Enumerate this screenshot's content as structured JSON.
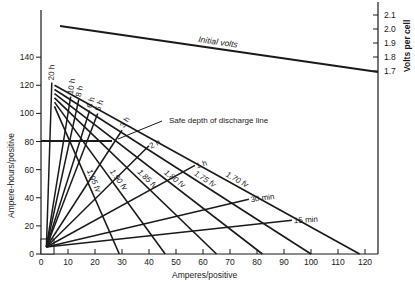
{
  "chart_data": {
    "type": "line",
    "title": "",
    "xlabel": "Amperes/positive",
    "ylabel": "Ampere-hours/positive",
    "y2label": "Volts per cell",
    "xlim": [
      0,
      125
    ],
    "ylim": [
      0,
      160
    ],
    "y2lim": [
      1.7,
      2.1
    ],
    "grid": false,
    "legend": "none",
    "x_ticks": [
      0,
      10,
      20,
      30,
      40,
      50,
      60,
      70,
      80,
      90,
      100,
      110,
      120
    ],
    "y_ticks": [
      0,
      20,
      40,
      60,
      80,
      100,
      120,
      140
    ],
    "y2_ticks": [
      "1.7",
      "1.8",
      "1.9",
      "2.0",
      "2.1"
    ],
    "initial_volts": {
      "label": "Initial volts",
      "points": [
        [
          7,
          2.08
        ],
        [
          125,
          1.69
        ]
      ]
    },
    "safe_depth": {
      "label": "Safe depth of discharge line",
      "ampere_hours": 80,
      "x_range": [
        0,
        26
      ]
    },
    "discharge_time_lines": [
      {
        "label": "20 h",
        "from": [
          2,
          5
        ],
        "to": [
          4,
          122
        ]
      },
      {
        "label": "10 h",
        "from": [
          2,
          5
        ],
        "to": [
          11,
          112
        ]
      },
      {
        "label": "8 h",
        "from": [
          2,
          5
        ],
        "to": [
          14,
          110
        ]
      },
      {
        "label": "6 h",
        "from": [
          2,
          5
        ],
        "to": [
          18,
          102
        ]
      },
      {
        "label": "5 h",
        "from": [
          2,
          5
        ],
        "to": [
          21,
          100
        ]
      },
      {
        "label": "3 h",
        "from": [
          2,
          5
        ],
        "to": [
          30,
          88
        ]
      },
      {
        "label": "2 h",
        "from": [
          2,
          5
        ],
        "to": [
          40,
          77
        ]
      },
      {
        "label": "1 h",
        "from": [
          2,
          5
        ],
        "to": [
          57,
          63
        ]
      },
      {
        "label": "30 min",
        "from": [
          2,
          5
        ],
        "to": [
          77,
          39
        ]
      },
      {
        "label": "15 min",
        "from": [
          2,
          5
        ],
        "to": [
          93,
          24
        ]
      }
    ],
    "final_voltage_lines": [
      {
        "label": "1.70 fv",
        "from": [
          5,
          120
        ],
        "to": [
          118,
          0
        ]
      },
      {
        "label": "1.75 fv",
        "from": [
          5,
          117
        ],
        "to": [
          100,
          0
        ]
      },
      {
        "label": "1.80 fv",
        "from": [
          5,
          114
        ],
        "to": [
          82,
          0
        ]
      },
      {
        "label": "1.85 fv",
        "from": [
          5,
          111
        ],
        "to": [
          65,
          0
        ]
      },
      {
        "label": "1.90 fv",
        "from": [
          5,
          108
        ],
        "to": [
          46,
          0
        ]
      },
      {
        "label": "1.95 fv",
        "from": [
          5,
          105
        ],
        "to": [
          29,
          0
        ]
      }
    ]
  },
  "labels": {
    "xlabel": "Amperes/positive",
    "ylabel": "Ampere-hours/positive",
    "y2label": "Volts per cell",
    "initial_volts": "Initial volts",
    "safe_depth": "Safe depth of discharge line",
    "x_ticks": [
      "0",
      "10",
      "20",
      "30",
      "40",
      "50",
      "60",
      "70",
      "80",
      "90",
      "100",
      "110",
      "120"
    ],
    "y_ticks": [
      "0",
      "20",
      "40",
      "60",
      "80",
      "100",
      "120",
      "140"
    ],
    "y2_ticks": [
      "2.1",
      "2.0",
      "1.9",
      "1.8",
      "1.7"
    ],
    "time": [
      "20 h",
      "10 h",
      "8 h",
      "6 h",
      "5 h",
      "3 h",
      "2 h",
      "1 h",
      "30 min",
      "15 min"
    ],
    "fv": [
      "1.70 fv",
      "1.75 fv",
      "1.80 fv",
      "1.85 fv",
      "1.90 fv",
      "1.95 fv"
    ]
  }
}
